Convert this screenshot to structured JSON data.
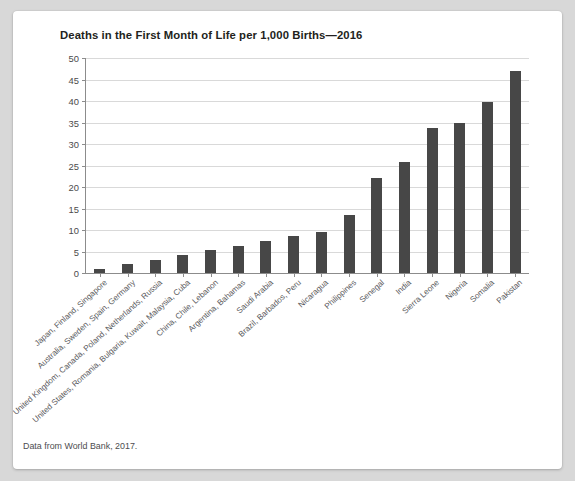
{
  "figure": {
    "title": "Deaths in the First Month of Life per 1,000 Births—2016",
    "caption": "Data from World Bank, 2017."
  },
  "chart_data": {
    "type": "bar",
    "title": "Deaths in the First Month of Life per 1,000 Births—2016",
    "subtitle": "",
    "xlabel": "",
    "ylabel": "",
    "ylim": [
      0,
      50
    ],
    "ytick_step": 5,
    "yticks": [
      0,
      5,
      10,
      15,
      20,
      25,
      30,
      35,
      40,
      45,
      50
    ],
    "ytick_labels": [
      "0",
      "5",
      "10",
      "15",
      "20",
      "25",
      "30",
      "35",
      "40",
      "45",
      "50"
    ],
    "grid": "horizontal",
    "legend": "none",
    "bar_color": "#474747",
    "xtick_rotation": -42,
    "categories": [
      "Japan, Finland, Singapore",
      "Australia, Sweden, Spain, Germany",
      "United Kingdom, Canada, Poland, Netherlands, Russia",
      "United States, Romania, Bulgaria, Kuwait, Malaysia, Cuba",
      "China, Chile, Lebanon",
      "Argentina, Bahamas",
      "Saudi Arabia",
      "Brazil, Barbados, Peru",
      "Nicaragua",
      "Philippines",
      "Senegal",
      "India",
      "Sierra Leone",
      "Nigeria",
      "Somalia",
      "Pakistan"
    ],
    "values": [
      1,
      2,
      3,
      4.2,
      5.3,
      6.3,
      7.4,
      8.5,
      9.5,
      13.5,
      22,
      25.8,
      33.8,
      34.8,
      39.8,
      47
    ],
    "annotations": []
  }
}
